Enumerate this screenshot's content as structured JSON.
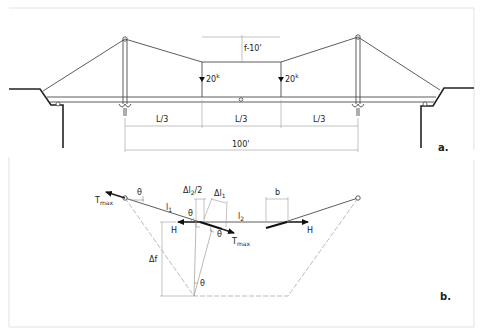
{
  "figure": {
    "panel_a": {
      "label": "a.",
      "sag_label": "f-10'",
      "load_left": "20",
      "load_right": "20",
      "load_unit": "k",
      "span_segments": [
        "L/3",
        "L/3",
        "L/3"
      ],
      "total_span": "100'"
    },
    "panel_b": {
      "label": "b.",
      "theta": "θ",
      "t_max_left": "T",
      "t_max_left_sub": "max",
      "t_max_right": "T",
      "t_max_right_sub": "max",
      "delta_l2_half": "Δl",
      "delta_l2_half_sub": "2",
      "delta_l2_half_suffix": "/2",
      "delta_l1": "Δl",
      "delta_l1_sub": "1",
      "l1": "l",
      "l1_sub": "1",
      "l2": "l",
      "l2_sub": "2",
      "b": "b",
      "h_left": "H",
      "h_right": "H",
      "delta_f": "Δf"
    }
  }
}
